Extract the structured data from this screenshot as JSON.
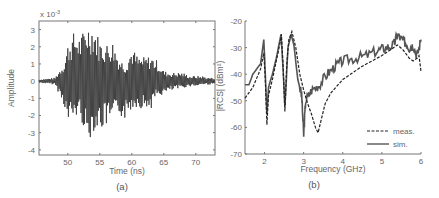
{
  "chart_data": [
    {
      "id": "a",
      "type": "line",
      "caption": "(a)",
      "title": "",
      "xlabel": "Time (ns)",
      "ylabel": "Amplitude",
      "y_multiplier": "x 10^-3",
      "xlim": [
        45.5,
        73
      ],
      "ylim": [
        -4.3,
        3.5
      ],
      "xticks": [
        50,
        55,
        60,
        65,
        70
      ],
      "yticks": [
        3,
        2,
        1,
        0,
        -1,
        -2,
        -3,
        -4
      ],
      "grid": false,
      "series": [
        {
          "name": "signal",
          "color": "#333333",
          "description": "Oscillating transient time-domain signal; quiet before ~49 ns, peak envelope ~+3.4/-3.8 near 53 ns, decaying to ~0.2 by 73 ns",
          "envelope": {
            "x": [
              45.5,
              48,
              49.5,
              50,
              51,
              52,
              53,
              54,
              55,
              56,
              57,
              58,
              59,
              60,
              61,
              62,
              63,
              64,
              65,
              66,
              67,
              68,
              69,
              70,
              71,
              72,
              73
            ],
            "upper": [
              0.1,
              0.2,
              1.2,
              2.2,
              2.9,
              2.6,
              3.4,
              3.4,
              2.4,
              2.2,
              2.4,
              1.4,
              1.0,
              2.0,
              1.4,
              1.4,
              1.5,
              1.2,
              0.6,
              0.5,
              0.5,
              0.5,
              0.3,
              0.3,
              0.3,
              0.2,
              0.2
            ],
            "lower": [
              -0.1,
              -0.2,
              -1.5,
              -2.6,
              -2.2,
              -2.0,
              -3.8,
              -2.9,
              -2.9,
              -2.7,
              -2.5,
              -2.0,
              -2.3,
              -1.6,
              -1.5,
              -1.7,
              -1.6,
              -0.9,
              -0.8,
              -0.6,
              -0.5,
              -0.4,
              -0.3,
              -0.3,
              -0.2,
              -0.2,
              -0.2
            ]
          }
        }
      ]
    },
    {
      "id": "b",
      "type": "line",
      "caption": "(b)",
      "title": "",
      "xlabel": "Frequency (GHz)",
      "ylabel": "|RCS| (dBm²)",
      "xlim": [
        1.5,
        6
      ],
      "ylim": [
        -70,
        -20
      ],
      "xticks": [
        2,
        3,
        4,
        5,
        6
      ],
      "yticks": [
        -20,
        -30,
        -40,
        -50,
        -60,
        -70
      ],
      "grid": false,
      "legend": {
        "position": "lower right",
        "entries": [
          "meas.",
          "sim."
        ]
      },
      "series": [
        {
          "name": "meas.",
          "style": "dashed",
          "color": "#222222",
          "x": [
            1.5,
            1.7,
            1.9,
            1.98,
            2.02,
            2.06,
            2.1,
            2.2,
            2.3,
            2.4,
            2.43,
            2.47,
            2.52,
            2.57,
            2.62,
            2.7,
            2.8,
            2.9,
            3.0,
            3.1,
            3.2,
            3.3,
            3.37,
            3.45,
            3.55,
            3.7,
            4.0,
            4.5,
            5.0,
            5.4,
            5.55,
            5.7,
            5.8,
            5.9,
            5.95,
            6.0
          ],
          "y": [
            -49,
            -45,
            -38,
            -32,
            -42,
            -59,
            -48,
            -42,
            -35,
            -28,
            -25,
            -35,
            -54,
            -36,
            -27,
            -24,
            -30,
            -40,
            -46,
            -51,
            -55,
            -60,
            -62,
            -57,
            -51,
            -47,
            -42,
            -37,
            -33,
            -29,
            -31,
            -34,
            -35,
            -34,
            -33,
            -39
          ]
        },
        {
          "name": "sim.",
          "style": "solid",
          "color": "#444444",
          "x": [
            1.5,
            1.6,
            1.7,
            1.8,
            1.9,
            1.98,
            2.02,
            2.06,
            2.1,
            2.2,
            2.3,
            2.38,
            2.42,
            2.47,
            2.52,
            2.6,
            2.68,
            2.75,
            2.85,
            2.95,
            3.0,
            3.05,
            3.2,
            3.4,
            3.6,
            3.8,
            4.0,
            4.3,
            4.6,
            4.9,
            5.1,
            5.3,
            5.4,
            5.5,
            5.6,
            5.7,
            5.8,
            5.9,
            6.0
          ],
          "y": [
            -44,
            -44,
            -40,
            -38,
            -36,
            -27,
            -40,
            -55,
            -45,
            -40,
            -34,
            -28,
            -25,
            -37,
            -52,
            -30,
            -25,
            -29,
            -42,
            -48,
            -63,
            -50,
            -46,
            -44,
            -40,
            -37,
            -35,
            -34,
            -33,
            -31,
            -30,
            -29,
            -25,
            -27,
            -28,
            -30,
            -29,
            -33,
            -27
          ]
        }
      ]
    }
  ],
  "plot_a": {
    "multiplier_label": "x 10",
    "multiplier_exp": "-3",
    "xlabel": "Time (ns)",
    "ylabel": "Amplitude",
    "caption": "(a)",
    "xtick_labels": [
      "50",
      "55",
      "60",
      "65",
      "70"
    ],
    "ytick_labels": [
      "3",
      "2",
      "1",
      "0",
      "-1",
      "-2",
      "-3",
      "-4"
    ]
  },
  "plot_b": {
    "xlabel": "Frequency (GHz)",
    "ylabel": "|RCS| (dBm²)",
    "caption": "(b)",
    "xtick_labels": [
      "2",
      "3",
      "4",
      "5",
      "6"
    ],
    "ytick_labels": [
      "-20",
      "-30",
      "-40",
      "-50",
      "-60",
      "-70"
    ],
    "legend_meas": "meas.",
    "legend_sim": "sim."
  }
}
